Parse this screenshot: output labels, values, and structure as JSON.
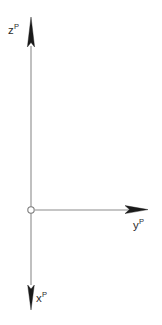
{
  "diagram": {
    "background_color": "#ffffff",
    "axis_line_color": "#8c8c8c",
    "arrow_color": "#1a1a1a",
    "origin": {
      "x": 31,
      "y": 210,
      "radius": 3.2,
      "fill_color": "#ffffff",
      "stroke_color": "#7a7a7a"
    },
    "axes": [
      {
        "id": "z",
        "base": "z",
        "superscript": "P",
        "label": "zP",
        "direction": "up",
        "label_position": "left-of-arrowhead",
        "line_from": [
          31,
          207
        ],
        "line_to": [
          31,
          20
        ]
      },
      {
        "id": "y",
        "base": "y",
        "superscript": "P",
        "label": "yP",
        "direction": "right",
        "label_position": "below-arrowhead",
        "line_from": [
          34,
          210
        ],
        "line_to": [
          146,
          210
        ]
      },
      {
        "id": "x",
        "base": "x",
        "superscript": "P",
        "label": "xP",
        "direction": "down",
        "label_position": "right-of-arrowhead",
        "line_from": [
          31,
          213
        ],
        "line_to": [
          31,
          309
        ]
      }
    ]
  }
}
